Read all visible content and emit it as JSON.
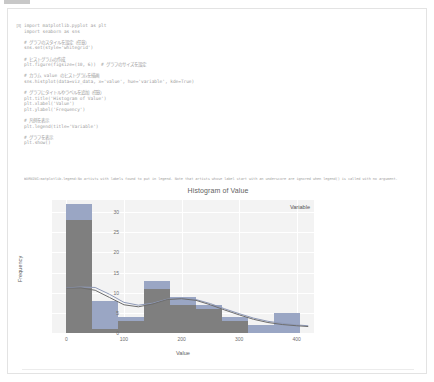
{
  "cell": {
    "prompt": "[3]",
    "code_lines": [
      "import matplotlib.pyplot as plt",
      "import seaborn as sns",
      "",
      "# グラフのスタイルを設定（任意）",
      "sns.set(style='whitegrid')",
      "",
      "# ヒストグラムの作成",
      "plt.figure(figsize=(10, 6))  # グラフのサイズを設定",
      "",
      "# カラム value のヒストグラムを描画",
      "sns.histplot(data=viz_data, x='value', hue='variable', kde=True)",
      "",
      "# グラフにタイトルやラベルを追加（任意）",
      "plt.title('Histogram of Value')",
      "plt.xlabel('Value')",
      "plt.ylabel('Frequency')",
      "",
      "# 凡例を表示",
      "plt.legend(title='Variable')",
      "",
      "# グラフを表示",
      "plt.show()"
    ],
    "warning": "WARNING:matplotlib.legend:No artists with labels found to put in legend.  Note that artists whose label start with an underscore are ignored when legend() is called with no argument."
  },
  "chart_data": {
    "type": "bar",
    "title": "Histogram of Value",
    "xlabel": "Value",
    "ylabel": "Frequency",
    "legend_title": "Variable",
    "legend_position": "upper-right",
    "grid": true,
    "xlim": [
      -25,
      430
    ],
    "ylim": [
      0,
      33
    ],
    "xticks": [
      0,
      100,
      200,
      300,
      400
    ],
    "yticks": [
      0,
      5,
      10,
      15,
      20,
      25,
      30
    ],
    "bin_width": 45,
    "bin_starts": [
      0,
      45,
      90,
      135,
      180,
      225,
      270,
      315,
      360
    ],
    "series": [
      {
        "name": "series-a",
        "color": "#9aa6c4",
        "values": [
          32,
          8,
          4,
          13,
          9,
          7,
          4,
          2,
          5
        ]
      },
      {
        "name": "series-b",
        "color": "#7f7f7f",
        "values": [
          28,
          1,
          3,
          11,
          7,
          6,
          3,
          0,
          0
        ]
      }
    ],
    "kde_curves": [
      {
        "name": "kde-a",
        "color": "#8f9ab8",
        "points": [
          [
            0,
            11.2
          ],
          [
            25,
            11.4
          ],
          [
            50,
            11.3
          ],
          [
            75,
            9.6
          ],
          [
            100,
            7.6
          ],
          [
            125,
            6.9
          ],
          [
            150,
            7.4
          ],
          [
            175,
            8.4
          ],
          [
            200,
            8.6
          ],
          [
            225,
            8.3
          ],
          [
            250,
            7.3
          ],
          [
            275,
            6.0
          ],
          [
            300,
            4.8
          ],
          [
            325,
            3.7
          ],
          [
            350,
            2.9
          ],
          [
            375,
            2.4
          ],
          [
            400,
            2.0
          ],
          [
            420,
            1.8
          ]
        ]
      },
      {
        "name": "kde-b",
        "color": "#6d6d6d",
        "points": [
          [
            0,
            11.1
          ],
          [
            25,
            11.2
          ],
          [
            50,
            10.6
          ],
          [
            75,
            8.8
          ],
          [
            100,
            7.0
          ],
          [
            125,
            6.5
          ],
          [
            150,
            7.2
          ],
          [
            175,
            8.3
          ],
          [
            200,
            8.5
          ],
          [
            225,
            8.1
          ],
          [
            250,
            7.0
          ],
          [
            275,
            5.7
          ],
          [
            300,
            4.5
          ],
          [
            325,
            3.4
          ],
          [
            350,
            2.6
          ],
          [
            375,
            2.1
          ],
          [
            400,
            1.8
          ],
          [
            420,
            1.6
          ]
        ]
      }
    ]
  }
}
